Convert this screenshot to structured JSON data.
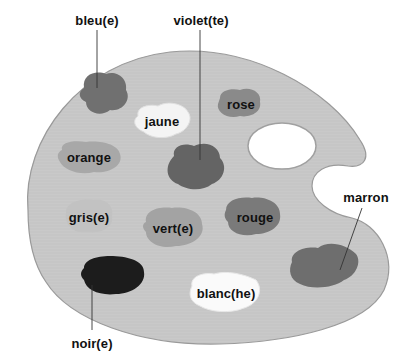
{
  "diagram": {
    "colors": {
      "background": "#ffffff",
      "palette": "#c9c9c9",
      "palette_edge": "#9a9a9a",
      "text": "#111111",
      "leader_line": "#333333"
    },
    "blobs": [
      {
        "id": "bleu",
        "label": "bleu(e)",
        "fill": "#707070",
        "cx": 104,
        "cy": 94
      },
      {
        "id": "jaune",
        "label": "jaune",
        "fill": "#f4f4f4",
        "cx": 162,
        "cy": 120
      },
      {
        "id": "violet",
        "label": "violet(te)",
        "fill": "#646464",
        "cx": 198,
        "cy": 166
      },
      {
        "id": "rose",
        "label": "rose",
        "fill": "#8a8a8a",
        "cx": 240,
        "cy": 104
      },
      {
        "id": "orange",
        "label": "orange",
        "fill": "#a8a8a8",
        "cx": 89,
        "cy": 156
      },
      {
        "id": "gris",
        "label": "gris(e)",
        "fill": "#c2c2c2",
        "cx": 89,
        "cy": 217
      },
      {
        "id": "vert",
        "label": "vert(e)",
        "fill": "#a3a3a3",
        "cx": 173,
        "cy": 227
      },
      {
        "id": "rouge",
        "label": "rouge",
        "fill": "#7a7a7a",
        "cx": 253,
        "cy": 216
      },
      {
        "id": "noir",
        "label": "noir(e)",
        "fill": "#1c1c1c",
        "cx": 112,
        "cy": 275
      },
      {
        "id": "blanc",
        "label": "blanc(he)",
        "fill": "#fafafa",
        "cx": 229,
        "cy": 292
      },
      {
        "id": "marron",
        "label": "marron",
        "fill": "#6e6e6e",
        "cx": 322,
        "cy": 263
      }
    ],
    "labels": {
      "bleu": "bleu(e)",
      "violet": "violet(te)",
      "rose": "rose",
      "jaune": "jaune",
      "orange": "orange",
      "gris": "gris(e)",
      "vert": "vert(e)",
      "rouge": "rouge",
      "marron": "marron",
      "noir": "noir(e)",
      "blanc": "blanc(he)"
    }
  }
}
